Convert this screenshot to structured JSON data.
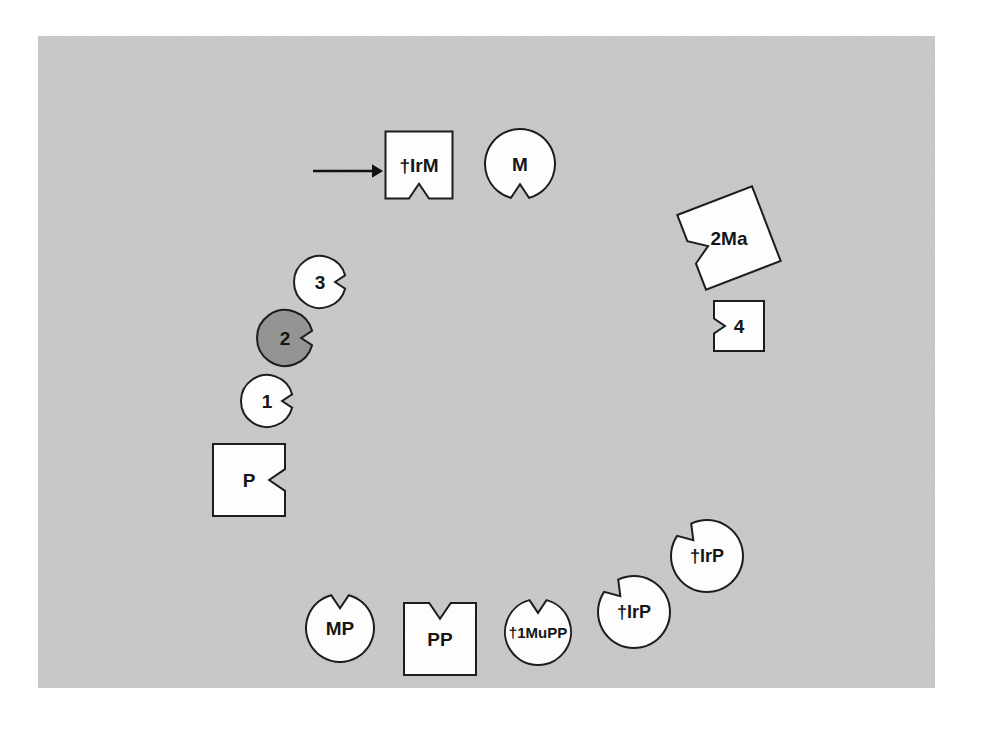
{
  "figure": {
    "canvas": {
      "width": 984,
      "height": 731
    },
    "panel": {
      "name": "gray-background-panel",
      "x": 38,
      "y": 36,
      "width": 897,
      "height": 652,
      "fill": "#c9c9c9",
      "noise_fill": "#cdcdcd"
    },
    "colors": {
      "background": "#ffffff",
      "panel": "#c9c9c9",
      "shape_fill": "#fdfdfd",
      "shape_highlight_fill": "#949494",
      "outline": "#1d1d1d",
      "text": "#161616",
      "arrow": "#101010"
    },
    "arrow": {
      "name": "pointer-arrow",
      "x1": 313,
      "y1": 171,
      "x2": 383,
      "y2": 171,
      "head_size": 11
    },
    "shapes": [
      {
        "id": "irm",
        "label": "†IrM",
        "kind": "square",
        "notch": "bottom",
        "cx": 419,
        "cy": 165,
        "size": 67,
        "rotation": 0,
        "fill": "#fdfdfd",
        "font_size": 19
      },
      {
        "id": "m",
        "label": "M",
        "kind": "circle",
        "notch": "bottom",
        "cx": 520,
        "cy": 164,
        "radius": 35,
        "rotation": 0,
        "fill": "#fdfdfd",
        "font_size": 19
      },
      {
        "id": "2ma",
        "label": "2Ma",
        "kind": "square",
        "notch": "left",
        "cx": 729,
        "cy": 238,
        "size": 80,
        "rotation": -21,
        "fill": "#fdfdfd",
        "font_size": 19
      },
      {
        "id": "4",
        "label": "4",
        "kind": "square",
        "notch": "left",
        "cx": 739,
        "cy": 326,
        "size": 50,
        "rotation": 0,
        "fill": "#fdfdfd",
        "font_size": 19
      },
      {
        "id": "3",
        "label": "3",
        "kind": "circle",
        "notch": "right",
        "cx": 320,
        "cy": 282,
        "radius": 26,
        "rotation": 0,
        "fill": "#fdfdfd",
        "font_size": 19
      },
      {
        "id": "2",
        "label": "2",
        "kind": "circle",
        "notch": "right",
        "cx": 285,
        "cy": 338,
        "radius": 28,
        "rotation": 0,
        "fill": "#949494",
        "font_size": 19
      },
      {
        "id": "1",
        "label": "1",
        "kind": "circle",
        "notch": "right",
        "cx": 267,
        "cy": 401,
        "radius": 26,
        "rotation": 0,
        "fill": "#fdfdfd",
        "font_size": 19
      },
      {
        "id": "p",
        "label": "P",
        "kind": "square",
        "notch": "right",
        "cx": 249,
        "cy": 480,
        "size": 72,
        "rotation": 0,
        "fill": "#fdfdfd",
        "font_size": 19
      },
      {
        "id": "irp-upper",
        "label": "†IrP",
        "kind": "circle",
        "notch": "top-left",
        "cx": 707,
        "cy": 556,
        "radius": 36,
        "rotation": 0,
        "fill": "#fdfdfd",
        "font_size": 18
      },
      {
        "id": "irp-lower",
        "label": "†IrP",
        "kind": "circle",
        "notch": "top-left",
        "cx": 634,
        "cy": 612,
        "radius": 36,
        "rotation": 0,
        "fill": "#fdfdfd",
        "font_size": 18
      },
      {
        "id": "1mupp",
        "label": "†1MuPP",
        "kind": "circle",
        "notch": "top",
        "cx": 538,
        "cy": 632,
        "radius": 33,
        "rotation": 0,
        "fill": "#fdfdfd",
        "font_size": 15
      },
      {
        "id": "pp",
        "label": "PP",
        "kind": "square",
        "notch": "top",
        "cx": 440,
        "cy": 639,
        "size": 72,
        "rotation": 0,
        "fill": "#fdfdfd",
        "font_size": 19
      },
      {
        "id": "mp",
        "label": "MP",
        "kind": "circle",
        "notch": "top",
        "cx": 340,
        "cy": 628,
        "radius": 34,
        "rotation": 0,
        "fill": "#fdfdfd",
        "font_size": 19
      }
    ]
  }
}
